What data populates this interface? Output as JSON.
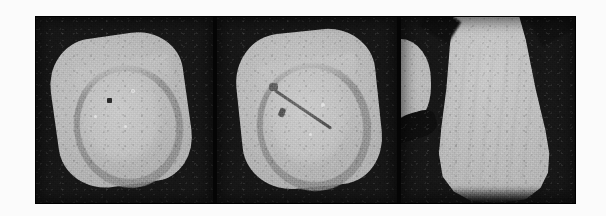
{
  "figure": {
    "kind": "medical-imaging-figure",
    "modality_label": "CT",
    "background_color": "#fbfbfb",
    "image_frame_color": "#000000",
    "panel_count": 3,
    "panels": [
      {
        "id": "panel-axial-1",
        "name": "axial-slice-pre",
        "view": "axial",
        "description": "Axial cross-section of a rounded-square specimen showing a bright cortical rim, a darker C-shaped internal ring and a small focal dark dot.",
        "background_color": "#171717",
        "tissue_color": "#b9b9b9",
        "ring_color": "#8d8d8d",
        "marker_color": "#2c2c2c",
        "features": [
          "cortical-rim",
          "dark-ring",
          "focal-dot"
        ]
      },
      {
        "id": "panel-axial-2",
        "name": "axial-slice-with-needle",
        "view": "axial",
        "description": "Axial cross-section at a comparable level with a linear hyperdense needle track running from upper-left to lower-right, plus an entry-site hub.",
        "background_color": "#171717",
        "tissue_color": "#bbbbbb",
        "ring_color": "#8d8d8d",
        "needle_color": "#5a5a5a",
        "features": [
          "cortical-rim",
          "dark-ring",
          "needle-track",
          "needle-hub"
        ]
      },
      {
        "id": "panel-sagittal",
        "name": "sagittal-slice",
        "view": "sagittal",
        "description": "Sagittal reformat showing a tapering cone-shaped bright structure that widens inferiorly with a rounded inferior margin; a partial bright lobe is cut off at the left edge.",
        "background_color": "#171717",
        "tissue_color": "#bfbfbf",
        "features": [
          "tapered-cone",
          "partial-side-lobe",
          "dark-wedge"
        ]
      }
    ]
  }
}
